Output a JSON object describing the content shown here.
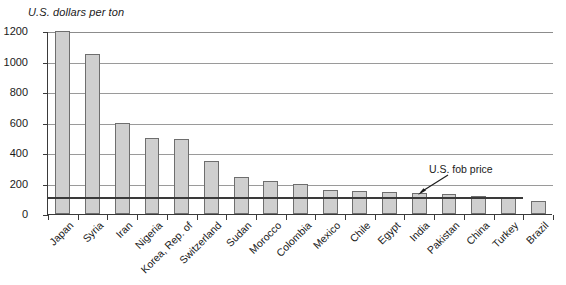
{
  "chart_data": {
    "type": "bar",
    "title": "",
    "ylabel": "U.S. dollars per ton",
    "xlabel": "",
    "ylim": [
      0,
      1200
    ],
    "yticks": [
      0,
      200,
      400,
      600,
      800,
      1000,
      1200
    ],
    "ytick_labels": [
      "0",
      "200",
      "400",
      "600",
      "800",
      "1000",
      "1200"
    ],
    "grid": true,
    "legend": null,
    "categories": [
      "Japan",
      "Syria",
      "Iran",
      "Nigeria",
      "Korea, Rep. of",
      "Switzerland",
      "Sudan",
      "Morocco",
      "Colombia",
      "Mexico",
      "Chile",
      "Egypt",
      "India",
      "Pakistan",
      "China",
      "Turkey",
      "Brazil"
    ],
    "values": [
      1200,
      1050,
      600,
      500,
      490,
      345,
      240,
      215,
      195,
      155,
      150,
      145,
      140,
      130,
      120,
      110,
      85
    ],
    "series": [
      {
        "name": "Import unit value",
        "values": [
          1200,
          1050,
          600,
          500,
          490,
          345,
          240,
          215,
          195,
          155,
          150,
          145,
          140,
          130,
          120,
          110,
          85
        ]
      }
    ],
    "reference_line": {
      "label": "U.S. fob price",
      "value": 115,
      "extends_from_category": "Japan",
      "extends_to_category": "Turkey"
    },
    "annotations": [
      {
        "text": "U.S. fob price",
        "points_to": "reference-line"
      }
    ],
    "bar_color": "#cfcfcf",
    "bar_edge_color": "#6e6e6e",
    "grid_color": "#9a9a9a",
    "axis_color": "#3a3a3a",
    "background": "#ffffff"
  }
}
